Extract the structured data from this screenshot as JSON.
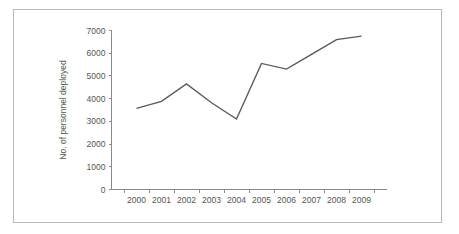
{
  "figure": {
    "background_color": "#ffffff",
    "border_color": "#b8b8b8",
    "axis_color": "#8a8a8a",
    "line_color": "#5a5a5a",
    "text_color": "#555555"
  },
  "chart_data": {
    "type": "line",
    "title": "",
    "xlabel": "",
    "ylabel": "No. of personnel deployed",
    "categories": [
      "2000",
      "2001",
      "2002",
      "2003",
      "2004",
      "2005",
      "2006",
      "2007",
      "2008",
      "2009"
    ],
    "x": [
      2000,
      2001,
      2002,
      2003,
      2004,
      2005,
      2006,
      2007,
      2008,
      2009
    ],
    "values": [
      3570,
      3880,
      4650,
      3820,
      3100,
      5550,
      5300,
      5950,
      6600,
      6750
    ],
    "series": [
      {
        "name": "No. of personnel deployed",
        "values": [
          3570,
          3880,
          4650,
          3820,
          3100,
          5550,
          5300,
          5950,
          6600,
          6750
        ]
      }
    ],
    "ylim": [
      0,
      7000
    ],
    "ytick_labels": [
      "0",
      "1000",
      "2000",
      "3000",
      "4000",
      "5000",
      "6000",
      "7000"
    ],
    "yticks": [
      0,
      1000,
      2000,
      3000,
      4000,
      5000,
      6000,
      7000
    ],
    "xtick_labels": [
      "2000",
      "2001",
      "2002",
      "2003",
      "2004",
      "2005",
      "2006",
      "2007",
      "2008",
      "2009"
    ],
    "grid": false,
    "legend": false,
    "legend_position": "none"
  }
}
